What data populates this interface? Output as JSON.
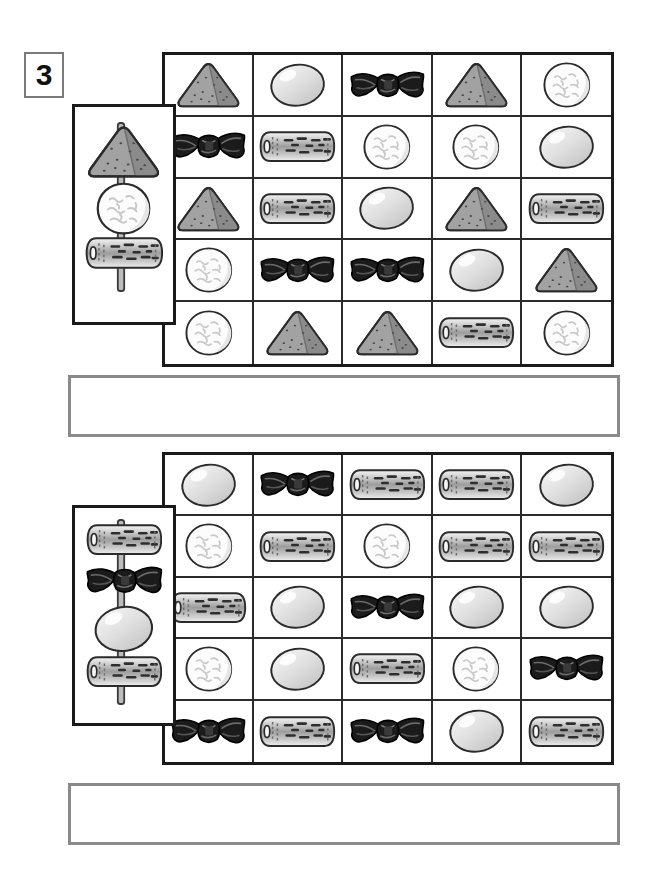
{
  "page": {
    "width": 654,
    "height": 886,
    "background": "#ffffff",
    "exercise_number": "3",
    "title_badge_border": "#7b7b7b"
  },
  "legend": {
    "item_types": [
      {
        "id": "onigiri",
        "label": "rice-triangle-onigiri",
        "fill": "#9a9a9a",
        "stroke": "#2b2b2b"
      },
      {
        "id": "egg",
        "label": "boiled-egg",
        "fill": "#dcdcdc",
        "stroke": "#2b2b2b"
      },
      {
        "id": "kombu",
        "label": "kombu-knot-bow",
        "fill": "#1c1c1c",
        "stroke": "#000000"
      },
      {
        "id": "chikuwa",
        "label": "chikuwa-fish-cake-log",
        "fill": "#b8b8b8",
        "stroke": "#2b2b2b"
      },
      {
        "id": "riceball",
        "label": "white-rice-ball",
        "fill": "#fbfbfb",
        "stroke": "#2b2b2b"
      }
    ]
  },
  "puzzles": [
    {
      "index": 1,
      "key": {
        "name": "skewer-key-1",
        "skewer_items_top_to_bottom": [
          "onigiri",
          "riceball",
          "chikuwa"
        ],
        "item_count": 3
      },
      "grid": {
        "rows": 5,
        "cols": 5,
        "cells": [
          [
            "onigiri",
            "egg",
            "kombu",
            "onigiri",
            "riceball"
          ],
          [
            "kombu",
            "chikuwa",
            "riceball",
            "riceball",
            "egg"
          ],
          [
            "onigiri",
            "chikuwa",
            "egg",
            "onigiri",
            "chikuwa"
          ],
          [
            "riceball",
            "kombu",
            "kombu",
            "egg",
            "onigiri"
          ],
          [
            "riceball",
            "onigiri",
            "onigiri",
            "chikuwa",
            "riceball"
          ]
        ]
      },
      "answer_box": {
        "name": "answer-box-1",
        "value": "",
        "placeholder": ""
      }
    },
    {
      "index": 2,
      "key": {
        "name": "skewer-key-2",
        "skewer_items_top_to_bottom": [
          "chikuwa",
          "kombu",
          "egg",
          "chikuwa"
        ],
        "item_count": 4
      },
      "grid": {
        "rows": 5,
        "cols": 5,
        "cells": [
          [
            "egg",
            "kombu",
            "chikuwa",
            "chikuwa",
            "egg"
          ],
          [
            "riceball",
            "chikuwa",
            "riceball",
            "chikuwa",
            "chikuwa"
          ],
          [
            "chikuwa",
            "egg",
            "kombu",
            "egg",
            "egg"
          ],
          [
            "riceball",
            "egg",
            "chikuwa",
            "riceball",
            "kombu"
          ],
          [
            "kombu",
            "chikuwa",
            "kombu",
            "egg",
            "chikuwa"
          ]
        ]
      },
      "answer_box": {
        "name": "answer-box-2",
        "value": "",
        "placeholder": ""
      }
    }
  ]
}
